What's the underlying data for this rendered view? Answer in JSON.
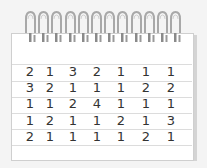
{
  "notepad": {
    "grid": [
      [
        "2",
        "1",
        "3",
        "2",
        "1",
        "1",
        "1"
      ],
      [
        "3",
        "2",
        "1",
        "1",
        "1",
        "2",
        "2"
      ],
      [
        "1",
        "1",
        "2",
        "4",
        "1",
        "1",
        "1"
      ],
      [
        "1",
        "2",
        "1",
        "1",
        "2",
        "1",
        "3"
      ],
      [
        "2",
        "1",
        "1",
        "1",
        "1",
        "2",
        "1"
      ]
    ],
    "ring_count": 12,
    "colors": {
      "paper": "#ffffff",
      "background": "#f4f4f4",
      "ink": "#333333",
      "rule": "#dcdcdc",
      "ring": "#a0a0a0"
    }
  }
}
